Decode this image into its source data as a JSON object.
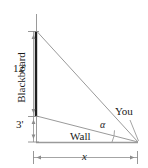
{
  "figure": {
    "type": "geometry-diagram",
    "background_color": "#ffffff",
    "line_color": "#8c8c8c",
    "blackboard_color": "#1a1a1a",
    "text_color": "#1a1a1a",
    "labels": {
      "height_upper": "12'",
      "height_lower": "3'",
      "blackboard": "Blackboard",
      "wall": "Wall",
      "viewer": "You",
      "angle": "α",
      "base": "x"
    },
    "geometry": {
      "wall_x": 36,
      "wall_top_y": 14,
      "blackboard_top_y": 31,
      "blackboard_bottom_y": 116,
      "baseline_y": 142,
      "apex_x": 138,
      "dim_line_x": 33,
      "dim_base_y": 157,
      "dim_base_left_x": 33,
      "dim_base_right_x": 138
    }
  }
}
